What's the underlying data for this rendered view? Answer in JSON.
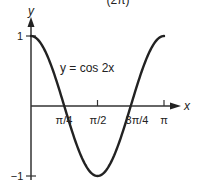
{
  "chart_data": {
    "type": "line",
    "title": "(2π)",
    "equation_label": "y = cos 2x",
    "xlabel": "x",
    "ylabel": "y",
    "xlim": [
      0,
      3.14159
    ],
    "ylim": [
      -1,
      1
    ],
    "grid": false,
    "legend": null,
    "x_ticks": [
      {
        "value": 0.7854,
        "label": "π/4"
      },
      {
        "value": 1.5708,
        "label": "π/2"
      },
      {
        "value": 2.3562,
        "label": "3π/4"
      },
      {
        "value": 3.1416,
        "label": "π"
      }
    ],
    "y_ticks": [
      {
        "value": 1,
        "label": "1"
      },
      {
        "value": -1,
        "label": "−1"
      }
    ],
    "series": [
      {
        "name": "y = cos 2x",
        "x": [
          0,
          0.3927,
          0.7854,
          1.1781,
          1.5708,
          1.9635,
          2.3562,
          2.7489,
          3.1416
        ],
        "y": [
          1,
          0.7071,
          0,
          -0.7071,
          -1,
          -0.7071,
          0,
          0.7071,
          1
        ]
      }
    ]
  },
  "labels": {
    "title_cropped": "(2π)",
    "y_axis": "y",
    "x_axis": "x",
    "curve": "y = cos 2x",
    "tick_pi_4": "π/4",
    "tick_pi_2": "π/2",
    "tick_3pi_4": "3π/4",
    "tick_pi": "π",
    "tick_one": "1",
    "tick_neg_one": "−1"
  },
  "colors": {
    "axis": "#333333",
    "curve": "#222222"
  }
}
